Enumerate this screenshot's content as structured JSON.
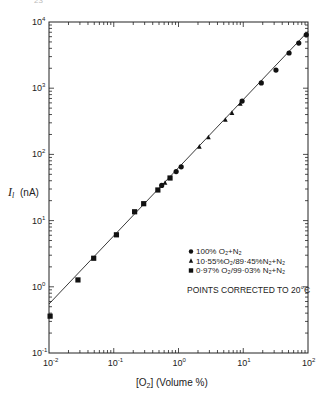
{
  "page_number": "23",
  "chart_data": {
    "type": "scatter",
    "title": "",
    "xlabel": "[O2] (Volume %)",
    "ylabel": "I_l (nA)",
    "xscale": "log",
    "yscale": "log",
    "xlim": [
      0.01,
      100
    ],
    "ylim": [
      0.1,
      10000
    ],
    "x_ticks": [
      "10^-2",
      "10^-1",
      "10^0",
      "10^1",
      "10^2"
    ],
    "y_ticks": [
      "10^-1",
      "10^0",
      "10^1",
      "10^2",
      "10^3",
      "10^4"
    ],
    "grid": false,
    "legend_position": "lower right (inside)",
    "annotation": "POINTS CORRECTED TO 20C",
    "series": [
      {
        "name": "100% O2 + N2",
        "marker": "circle",
        "points": [
          [
            0.55,
            34
          ],
          [
            0.92,
            55
          ],
          [
            1.1,
            65
          ],
          [
            9.6,
            640
          ],
          [
            19,
            1200
          ],
          [
            32,
            1880
          ],
          [
            51,
            3400
          ],
          [
            72,
            4800
          ],
          [
            94,
            6400
          ]
        ]
      },
      {
        "name": "10.55% O2/89.45% N2 + N2",
        "marker": "triangle",
        "points": [
          [
            0.62,
            37
          ],
          [
            2.1,
            130
          ],
          [
            2.9,
            180
          ],
          [
            5.3,
            330
          ],
          [
            6.7,
            420
          ],
          [
            9.0,
            580
          ]
        ]
      },
      {
        "name": "0.97% O2/99.03% N2 + N2",
        "marker": "square",
        "points": [
          [
            0.0104,
            0.36
          ],
          [
            0.028,
            1.27
          ],
          [
            0.049,
            2.7
          ],
          [
            0.11,
            6.1
          ],
          [
            0.21,
            13.6
          ],
          [
            0.29,
            18
          ],
          [
            0.48,
            29
          ],
          [
            0.74,
            44
          ]
        ]
      }
    ],
    "fit_line": {
      "x": [
        0.01,
        100
      ],
      "y": [
        0.55,
        7200
      ]
    }
  },
  "labels": {
    "x_tick_bases": [
      "10",
      "10",
      "10",
      "10",
      "10"
    ],
    "x_tick_exps": [
      "-2",
      "-1",
      "0",
      "1",
      "2"
    ],
    "y_tick_bases": [
      "10",
      "10",
      "10",
      "10",
      "10",
      "10"
    ],
    "y_tick_exps": [
      "-1",
      "0",
      "1",
      "2",
      "3",
      "4"
    ],
    "xlabel_prefix": "[O",
    "xlabel_sub": "2",
    "xlabel_suffix": "] (Volume %)",
    "ylabel_main": "I",
    "ylabel_sub": "l",
    "ylabel_unit": "(nA)",
    "legend": [
      {
        "marker": "circle",
        "text": "100% O₂+N₂"
      },
      {
        "marker": "triangle",
        "text": "10·55%O₂/89·45%N₂+N₂"
      },
      {
        "marker": "square",
        "text": "0·97% O₂/99·03% N₂+N₂"
      }
    ],
    "annotation": "POINTS CORRECTED TO 20°C"
  }
}
